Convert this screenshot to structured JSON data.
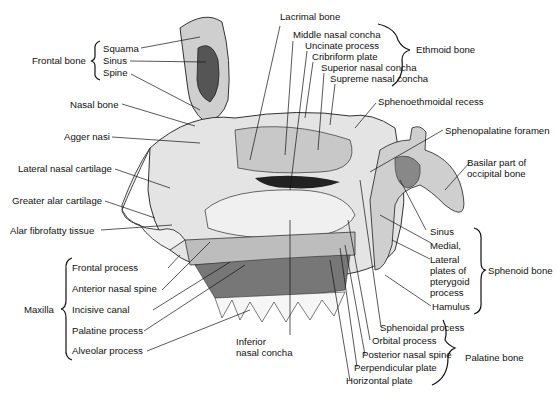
{
  "figure": {
    "groups": [
      {
        "id": "frontal",
        "name": "Frontal bone",
        "parts": [
          "Squama",
          "Sinus",
          "Spine"
        ]
      },
      {
        "id": "ethmoid",
        "name": "Ethmoid bone",
        "parts": [
          "Middle nasal concha",
          "Uncinate process",
          "Cribriform plate",
          "Superior nasal concha",
          "Supreme nasal concha"
        ]
      },
      {
        "id": "maxilla",
        "name": "Maxilla",
        "parts": [
          "Frontal process",
          "Anterior nasal spine",
          "Incisive canal",
          "Palatine process",
          "Alveolar process"
        ]
      },
      {
        "id": "sphenoid",
        "name": "Sphenoid bone",
        "parts": [
          "Sinus",
          "Medial,",
          "Lateral plates of pterygoid process",
          "Hamulus"
        ]
      },
      {
        "id": "palatine",
        "name": "Palatine bone",
        "parts": [
          "Sphenoidal process",
          "Orbital process",
          "Posterior nasal spine",
          "Perpendicular plate",
          "Horizontal plate"
        ]
      }
    ],
    "labels": {
      "lacrimal_bone": "Lacrimal bone",
      "nasal_bone": "Nasal bone",
      "agger_nasi": "Agger nasi",
      "lateral_nasal_cartilage": "Lateral nasal cartilage",
      "greater_alar_cartilage": "Greater alar cartilage",
      "alar_fibrofatty_tissue": "Alar fibrofatty tissue",
      "sphenoethmoidal_recess": "Sphenoethmoidal recess",
      "sphenopalatine_foramen": "Sphenopalatine foramen",
      "basilar_part": "Basilar part of occipital bone",
      "inferior_nasal_concha_1": "Inferior",
      "inferior_nasal_concha_2": "nasal concha",
      "lateral_plates_1": "Lateral",
      "lateral_plates_2": "plates of",
      "lateral_plates_3": "pterygoid",
      "lateral_plates_4": "process",
      "basilar_1": "Basilar part of",
      "basilar_2": "occipital bone"
    },
    "colors": {
      "ink": "#111111",
      "bone": "#d9d9d9",
      "bone_dark": "#8a8a8a",
      "cavity": "#2a2a2a"
    }
  }
}
